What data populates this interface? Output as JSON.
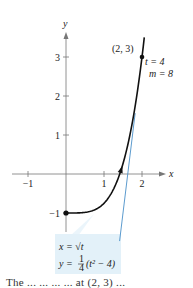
{
  "figure": {
    "x_axis_label": "x",
    "y_axis_label": "y",
    "x_ticks": [
      {
        "value": -1,
        "label": "−1"
      },
      {
        "value": 1,
        "label": "1"
      },
      {
        "value": 2,
        "label": "2"
      }
    ],
    "y_ticks": [
      {
        "value": -1,
        "label": "−1"
      },
      {
        "value": 1,
        "label": "1"
      },
      {
        "value": 2,
        "label": "2"
      },
      {
        "value": 3,
        "label": "3"
      }
    ],
    "curve": {
      "description": "parametric curve x = sqrt(t), y = (t^2 - 4)/4, equivalently y = (x^4 - 4)/4",
      "x_range": [
        0,
        2.06
      ],
      "start_point": [
        0,
        -1
      ],
      "arrow_at_x": 1.45,
      "color": "#111111"
    },
    "tangent_line": {
      "point": [
        2,
        3
      ],
      "slope": 8,
      "x_range": [
        1.41,
        1.82
      ],
      "color": "#4a90c8"
    },
    "point_label": "(2, 3)",
    "annotation_t": "t = 4",
    "annotation_m": "m = 8",
    "equation_box": {
      "line1": "x = √t",
      "line2_prefix": "y = ",
      "line2_frac_num": "1",
      "line2_frac_den": "4",
      "line2_suffix": "(t² − 4)",
      "background": "#e3f1f9"
    },
    "axis_color": "#777777"
  },
  "caption": {
    "text": "The ...  ...  ...  ...  at (2, 3) ..."
  }
}
